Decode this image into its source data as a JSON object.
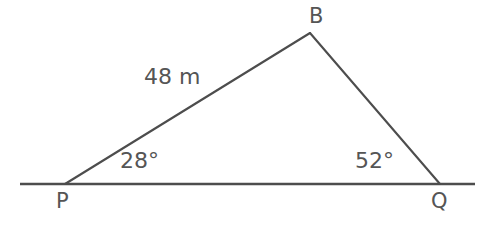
{
  "figure": {
    "type": "geometry-diagram",
    "shape": "triangle-on-horizontal-line",
    "background_color": "#ffffff",
    "stroke_color": "#4d4d4d",
    "text_color": "#555555",
    "vertices": {
      "P": {
        "label": "P",
        "x": 65,
        "y": 184
      },
      "Q": {
        "label": "Q",
        "x": 440,
        "y": 184
      },
      "B": {
        "label": "B",
        "x": 310,
        "y": 33
      }
    },
    "baseline": {
      "x1": 20,
      "y1": 184,
      "x2": 475,
      "y2": 184
    },
    "sides": [
      {
        "name": "PB",
        "from": "P",
        "to": "B",
        "measure_label": "48 m"
      },
      {
        "name": "BQ",
        "from": "B",
        "to": "Q",
        "measure_label": ""
      },
      {
        "name": "PQ",
        "from": "P",
        "to": "Q",
        "measure_label": ""
      }
    ],
    "angles": [
      {
        "at": "P",
        "label": "28°",
        "value": 28
      },
      {
        "at": "Q",
        "label": "52°",
        "value": 52
      }
    ]
  },
  "labels": {
    "vertex_p": "P",
    "vertex_q": "Q",
    "vertex_b": "B",
    "side_pb": "48 m",
    "angle_p": "28°",
    "angle_q": "52°"
  }
}
